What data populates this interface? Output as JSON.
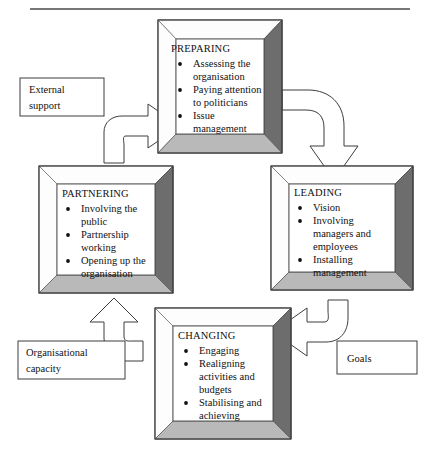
{
  "diagram": {
    "type": "cycle-flow-diagram",
    "title": "",
    "canvas": {
      "width": 435,
      "height": 455,
      "background": "#ffffff"
    },
    "colors": {
      "outline": "#3a3a3a",
      "frame_light": "#fdfdfd",
      "frame_bottom": "#b9b9b9",
      "frame_right": "#6d6d6d",
      "inner": "#ffffff",
      "text": "#111111"
    },
    "stages": [
      {
        "id": "preparing",
        "title": "PREPARING",
        "bullets": [
          [
            "Assessing the",
            "organisation"
          ],
          [
            "Paying attention",
            "to politicians"
          ],
          [
            "Issue",
            "management"
          ]
        ]
      },
      {
        "id": "leading",
        "title": "LEADING",
        "bullets": [
          [
            "Vision"
          ],
          [
            "Involving",
            "managers and",
            "employees"
          ],
          [
            "Installing",
            "management"
          ]
        ]
      },
      {
        "id": "changing",
        "title": "CHANGING",
        "bullets": [
          [
            "Engaging"
          ],
          [
            "Realigning",
            "activities and",
            "budgets"
          ],
          [
            "Stabilising and",
            "achieving"
          ]
        ]
      },
      {
        "id": "partnering",
        "title": "PARTNERING",
        "bullets": [
          [
            "Involving the",
            "public"
          ],
          [
            "Partnership",
            "working"
          ],
          [
            "Opening up the",
            "organisation"
          ]
        ]
      }
    ],
    "inputs": [
      {
        "id": "external-support",
        "lines": [
          "External",
          "support"
        ],
        "feeds": "preparing",
        "direction": "right"
      },
      {
        "id": "organisational-capacity",
        "lines": [
          "Organisational",
          "capacity"
        ],
        "feeds": "partnering",
        "direction": "up"
      },
      {
        "id": "goals",
        "lines": [
          "Goals"
        ],
        "feeds": "changing",
        "direction": "left"
      }
    ],
    "flow": [
      {
        "from": "partnering",
        "to": "preparing",
        "direction": "up-right"
      },
      {
        "from": "preparing",
        "to": "leading",
        "direction": "right-down"
      },
      {
        "from": "leading",
        "to": "changing",
        "direction": "down-left"
      },
      {
        "from": "changing",
        "to": "partnering",
        "direction": "left-up"
      }
    ]
  }
}
